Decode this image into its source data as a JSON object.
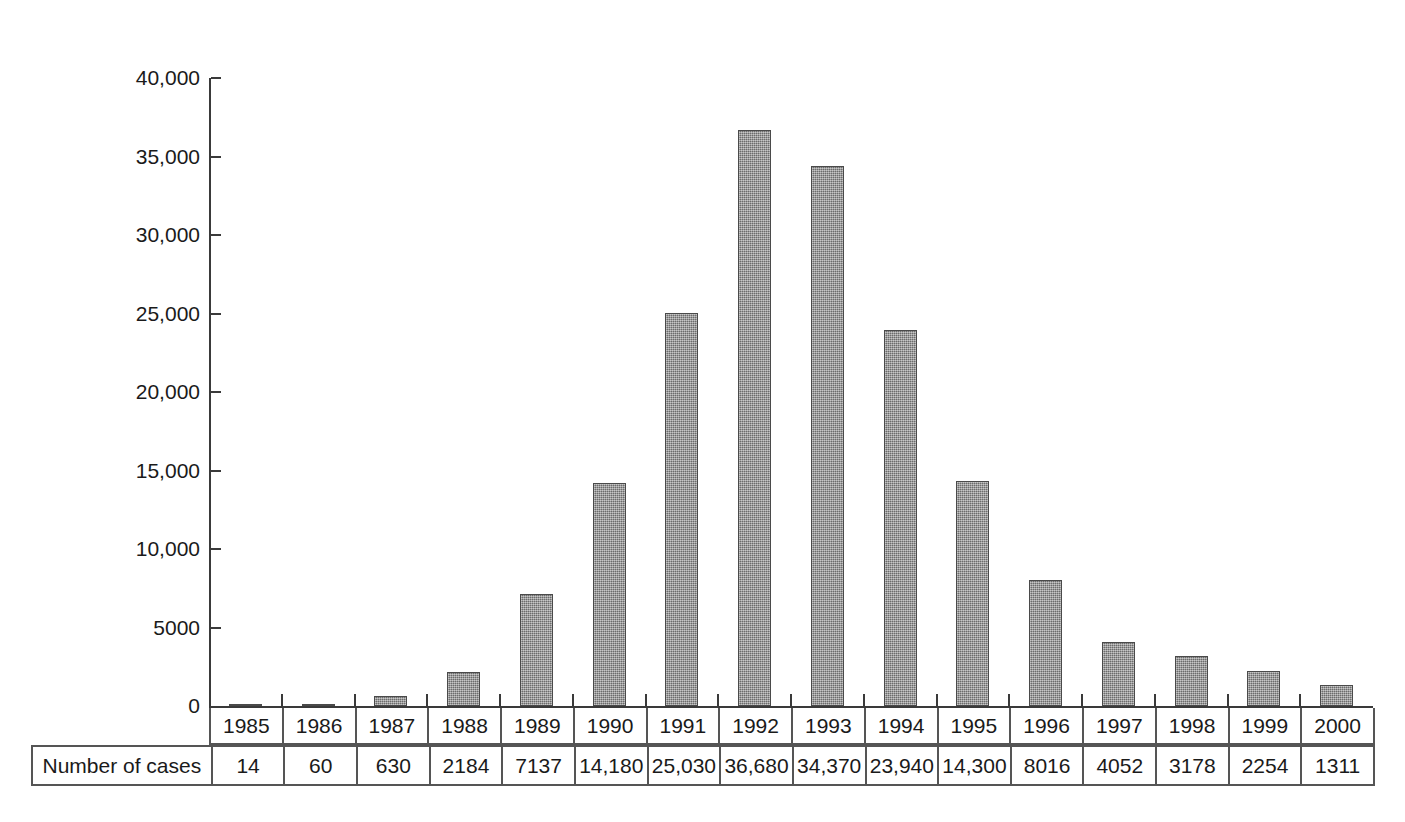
{
  "chart_data": {
    "type": "bar",
    "title": "",
    "xlabel": "",
    "ylabel": "",
    "categories": [
      "1985",
      "1986",
      "1987",
      "1988",
      "1989",
      "1990",
      "1991",
      "1992",
      "1993",
      "1994",
      "1995",
      "1996",
      "1997",
      "1998",
      "1999",
      "2000"
    ],
    "values": [
      14,
      60,
      630,
      2184,
      7137,
      14180,
      25030,
      36680,
      34370,
      23940,
      14300,
      8016,
      4052,
      3178,
      2254,
      1311
    ],
    "value_labels": [
      "14",
      "60",
      "630",
      "2184",
      "7137",
      "14,180",
      "25,030",
      "36,680",
      "34,370",
      "23,940",
      "14,300",
      "8016",
      "4052",
      "3178",
      "2254",
      "1311"
    ],
    "ylim": [
      0,
      40000
    ],
    "y_ticks": [
      0,
      5000,
      10000,
      15000,
      20000,
      25000,
      30000,
      35000,
      40000
    ],
    "y_tick_labels": [
      "0",
      "5000",
      "10,000",
      "15,000",
      "20,000",
      "25,000",
      "30,000",
      "35,000",
      "40,000"
    ],
    "grid": false,
    "legend": "none",
    "series_name": "Number of cases",
    "bar_color": "#8c8c8c",
    "bar_border_color": "#4a4a4a",
    "axis_color": "#3a3a3a"
  },
  "table": {
    "row_label": "Number of cases",
    "years": [
      "1985",
      "1986",
      "1987",
      "1988",
      "1989",
      "1990",
      "1991",
      "1992",
      "1993",
      "1994",
      "1995",
      "1996",
      "1997",
      "1998",
      "1999",
      "2000"
    ],
    "values": [
      "14",
      "60",
      "630",
      "2184",
      "7137",
      "14,180",
      "25,030",
      "36,680",
      "34,370",
      "23,940",
      "14,300",
      "8016",
      "4052",
      "3178",
      "2254",
      "1311"
    ]
  }
}
